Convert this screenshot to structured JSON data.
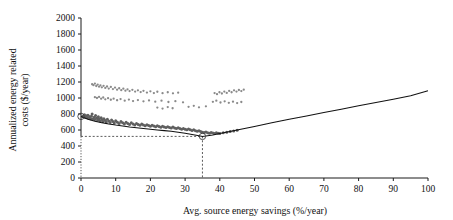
{
  "chart_data": {
    "type": "scatter",
    "title": "",
    "xlabel": "Avg. source energy savings (%/year)",
    "ylabel_line1": "Annualized energy related",
    "ylabel_line2": "costs ($/year)",
    "xlim": [
      0,
      100
    ],
    "ylim": [
      0,
      2000
    ],
    "xticks": [
      0,
      10,
      20,
      30,
      40,
      50,
      60,
      70,
      80,
      90,
      100
    ],
    "yticks": [
      0,
      200,
      400,
      600,
      800,
      1000,
      1200,
      1400,
      1600,
      1800,
      2000
    ],
    "xtick_labels": [
      "0",
      "10",
      "20",
      "30",
      "40",
      "50",
      "60",
      "70",
      "80",
      "90",
      "100"
    ],
    "ytick_labels": [
      "0",
      "200",
      "400",
      "600",
      "800",
      "1000",
      "1200",
      "1400",
      "1600",
      "1800",
      "2000"
    ],
    "grid": false,
    "legend": "none",
    "annotations": {
      "optimum_x": 35,
      "optimum_y": 520,
      "baseline_y": 770,
      "reference_h_line_value": 520,
      "reference_v_line_value": 35
    },
    "series": [
      {
        "name": "Cost-optimal frontier",
        "type": "line",
        "x": [
          0,
          2,
          4,
          6,
          8,
          10,
          12,
          14,
          16,
          18,
          20,
          22,
          24,
          26,
          28,
          30,
          32,
          34,
          35,
          36,
          38,
          40,
          45,
          50,
          55,
          60,
          65,
          70,
          75,
          80,
          85,
          90,
          95,
          100
        ],
        "y": [
          770,
          735,
          710,
          692,
          676,
          662,
          650,
          638,
          628,
          618,
          609,
          600,
          592,
          584,
          572,
          560,
          545,
          528,
          520,
          524,
          538,
          556,
          600,
          645,
          690,
          733,
          776,
          818,
          860,
          902,
          944,
          985,
          1027,
          1090
        ]
      },
      {
        "name": "Lower dense cluster",
        "type": "scatter",
        "points": [
          [
            0.4,
            772
          ],
          [
            0.7,
            768
          ],
          [
            1.0,
            790
          ],
          [
            1.2,
            760
          ],
          [
            1.5,
            778
          ],
          [
            1.8,
            755
          ],
          [
            2.0,
            785
          ],
          [
            2.2,
            748
          ],
          [
            2.5,
            765
          ],
          [
            2.8,
            742
          ],
          [
            3.0,
            772
          ],
          [
            3.2,
            800
          ],
          [
            3.5,
            738
          ],
          [
            3.8,
            758
          ],
          [
            4.0,
            730
          ],
          [
            4.2,
            780
          ],
          [
            4.5,
            748
          ],
          [
            4.8,
            722
          ],
          [
            5.0,
            765
          ],
          [
            5.2,
            740
          ],
          [
            5.5,
            714
          ],
          [
            5.8,
            752
          ],
          [
            6.0,
            730
          ],
          [
            6.3,
            708
          ],
          [
            6.6,
            742
          ],
          [
            7.0,
            720
          ],
          [
            7.3,
            700
          ],
          [
            7.6,
            735
          ],
          [
            8.0,
            712
          ],
          [
            8.4,
            694
          ],
          [
            8.8,
            726
          ],
          [
            9.2,
            706
          ],
          [
            9.6,
            688
          ],
          [
            10.0,
            716
          ],
          [
            10.5,
            698
          ],
          [
            11.0,
            682
          ],
          [
            11.5,
            706
          ],
          [
            12.0,
            690
          ],
          [
            12.5,
            676
          ],
          [
            13.0,
            698
          ],
          [
            13.5,
            682
          ],
          [
            14.0,
            670
          ],
          [
            14.5,
            690
          ],
          [
            15.0,
            676
          ],
          [
            15.5,
            664
          ],
          [
            16.0,
            682
          ],
          [
            16.5,
            670
          ],
          [
            17.0,
            658
          ],
          [
            17.5,
            674
          ],
          [
            18.0,
            662
          ],
          [
            18.5,
            652
          ],
          [
            19.0,
            666
          ],
          [
            19.5,
            656
          ],
          [
            20.0,
            646
          ],
          [
            20.5,
            660
          ],
          [
            21.0,
            650
          ],
          [
            21.5,
            640
          ],
          [
            22.0,
            654
          ],
          [
            22.5,
            644
          ],
          [
            23.0,
            635
          ],
          [
            23.5,
            648
          ],
          [
            24.0,
            638
          ],
          [
            24.5,
            630
          ],
          [
            25.0,
            642
          ],
          [
            25.5,
            632
          ],
          [
            26.0,
            624
          ],
          [
            26.5,
            636
          ],
          [
            27.0,
            626
          ],
          [
            27.5,
            618
          ],
          [
            28.0,
            628
          ],
          [
            28.5,
            618
          ],
          [
            29.0,
            610
          ],
          [
            29.5,
            620
          ],
          [
            30.0,
            610
          ],
          [
            30.5,
            602
          ],
          [
            31.0,
            612
          ],
          [
            31.5,
            602
          ],
          [
            32.0,
            594
          ],
          [
            32.5,
            602
          ],
          [
            33.0,
            592
          ],
          [
            33.5,
            584
          ],
          [
            34.0,
            590
          ],
          [
            34.5,
            580
          ],
          [
            35.0,
            572
          ],
          [
            35.5,
            568
          ],
          [
            36.0,
            574
          ],
          [
            36.5,
            566
          ],
          [
            37.0,
            560
          ],
          [
            37.5,
            568
          ],
          [
            38.0,
            562
          ],
          [
            38.5,
            556
          ],
          [
            39.0,
            566
          ],
          [
            39.5,
            560
          ],
          [
            40.0,
            556
          ],
          [
            41.0,
            566
          ],
          [
            42.0,
            572
          ],
          [
            43.0,
            580
          ],
          [
            44.0,
            588
          ],
          [
            45.0,
            596
          ]
        ]
      },
      {
        "name": "Upper scatter cluster",
        "type": "scatter",
        "points": [
          [
            3.2,
            1172
          ],
          [
            3.6,
            1160
          ],
          [
            4.0,
            1180
          ],
          [
            4.4,
            1150
          ],
          [
            4.8,
            1168
          ],
          [
            5.2,
            1142
          ],
          [
            5.6,
            1158
          ],
          [
            6.0,
            1134
          ],
          [
            6.5,
            1152
          ],
          [
            7.0,
            1126
          ],
          [
            7.5,
            1144
          ],
          [
            8.0,
            1118
          ],
          [
            8.6,
            1138
          ],
          [
            9.2,
            1112
          ],
          [
            9.8,
            1130
          ],
          [
            10.4,
            1104
          ],
          [
            11.0,
            1122
          ],
          [
            11.6,
            1098
          ],
          [
            12.2,
            1116
          ],
          [
            12.8,
            1092
          ],
          [
            13.4,
            1108
          ],
          [
            14.0,
            1086
          ],
          [
            14.8,
            1102
          ],
          [
            15.6,
            1080
          ],
          [
            16.4,
            1096
          ],
          [
            17.2,
            1074
          ],
          [
            18.0,
            1090
          ],
          [
            19.0,
            1068
          ],
          [
            20.0,
            1084
          ],
          [
            21.0,
            1062
          ],
          [
            22.0,
            1078
          ],
          [
            23.5,
            1060
          ],
          [
            25.0,
            1072
          ],
          [
            26.5,
            1058
          ],
          [
            28.0,
            1066
          ],
          [
            4.0,
            1010
          ],
          [
            4.6,
            1000
          ],
          [
            5.2,
            1014
          ],
          [
            5.8,
            992
          ],
          [
            6.4,
            1006
          ],
          [
            7.0,
            984
          ],
          [
            7.8,
            998
          ],
          [
            8.6,
            978
          ],
          [
            9.4,
            992
          ],
          [
            10.4,
            972
          ],
          [
            11.4,
            986
          ],
          [
            12.6,
            966
          ],
          [
            13.8,
            980
          ],
          [
            15.0,
            962
          ],
          [
            16.4,
            974
          ],
          [
            18.0,
            958
          ],
          [
            19.6,
            970
          ],
          [
            21.4,
            954
          ],
          [
            23.2,
            966
          ],
          [
            25.2,
            950
          ],
          [
            27.2,
            960
          ],
          [
            29.4,
            946
          ],
          [
            38.5,
            1062
          ],
          [
            39.2,
            1048
          ],
          [
            39.9,
            1072
          ],
          [
            40.6,
            1056
          ],
          [
            41.3,
            1080
          ],
          [
            42.0,
            1064
          ],
          [
            42.7,
            1088
          ],
          [
            43.4,
            1072
          ],
          [
            44.1,
            1096
          ],
          [
            44.8,
            1080
          ],
          [
            45.5,
            1100
          ],
          [
            46.2,
            1086
          ],
          [
            46.9,
            1104
          ],
          [
            38.0,
            952
          ],
          [
            39.0,
            966
          ],
          [
            40.2,
            944
          ],
          [
            41.4,
            958
          ],
          [
            42.6,
            940
          ],
          [
            43.8,
            954
          ],
          [
            45.0,
            936
          ],
          [
            46.2,
            950
          ],
          [
            31.0,
            890
          ],
          [
            32.5,
            902
          ],
          [
            34.0,
            884
          ],
          [
            36.0,
            896
          ],
          [
            22.0,
            880
          ],
          [
            23.5,
            868
          ],
          [
            25.0,
            886
          ],
          [
            26.4,
            872
          ]
        ]
      }
    ]
  }
}
